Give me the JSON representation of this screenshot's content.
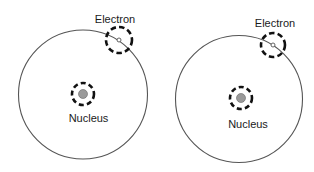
{
  "diagram": {
    "colors": {
      "background": "#ffffff",
      "orbit_stroke": "#555555",
      "dashed_stroke": "#111111",
      "nucleus_fill": "#9a9a9a",
      "nucleus_stroke": "#666666",
      "electron_fill": "#ffffff",
      "electron_stroke": "#555555",
      "text": "#1a1a1a"
    },
    "atoms": [
      {
        "orbit": {
          "cx": 83,
          "cy": 94.5,
          "r": 64.5
        },
        "nucleus": {
          "cx": 83,
          "cy": 94,
          "r": 4.5,
          "dash_r": 11,
          "label": "Nucleus",
          "label_x": 88.5,
          "label_y": 122
        },
        "electron": {
          "cx": 119,
          "cy": 40,
          "r": 2,
          "dash_r": 13,
          "label": "Electron",
          "label_x": 115,
          "label_y": 23
        }
      },
      {
        "orbit": {
          "cx": 239,
          "cy": 99,
          "r": 63.5
        },
        "nucleus": {
          "cx": 241,
          "cy": 98,
          "r": 4.5,
          "dash_r": 11,
          "label": "Nucleus",
          "label_x": 248,
          "label_y": 128
        },
        "electron": {
          "cx": 273,
          "cy": 45,
          "r": 2,
          "dash_r": 12,
          "label": "Electron",
          "label_x": 275,
          "label_y": 27
        }
      }
    ]
  }
}
